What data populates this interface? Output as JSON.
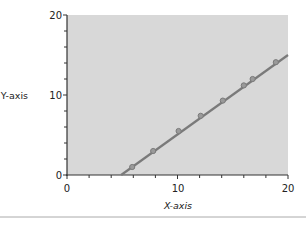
{
  "chart_data": {
    "type": "line",
    "title": "",
    "xlabel": "X-axis",
    "ylabel": "Y-axis",
    "xlim": [
      0,
      20
    ],
    "ylim": [
      0,
      20
    ],
    "x_ticks": [
      "0",
      "10",
      "20"
    ],
    "y_ticks": [
      "0",
      "10",
      "20"
    ],
    "grid": false,
    "legend": null,
    "background": "#d8d8d8",
    "series": [
      {
        "name": "data",
        "color": "#7a7a7a",
        "points": [
          {
            "x": 5.9,
            "y": 1.0
          },
          {
            "x": 7.8,
            "y": 3.0
          },
          {
            "x": 10.1,
            "y": 5.5
          },
          {
            "x": 12.1,
            "y": 7.4
          },
          {
            "x": 14.1,
            "y": 9.3
          },
          {
            "x": 16.0,
            "y": 11.2
          },
          {
            "x": 16.8,
            "y": 12.0
          },
          {
            "x": 18.9,
            "y": 14.1
          }
        ]
      }
    ],
    "fit_line": {
      "x0": 4.9,
      "y0": 0,
      "x1": 20,
      "y1": 15
    }
  }
}
